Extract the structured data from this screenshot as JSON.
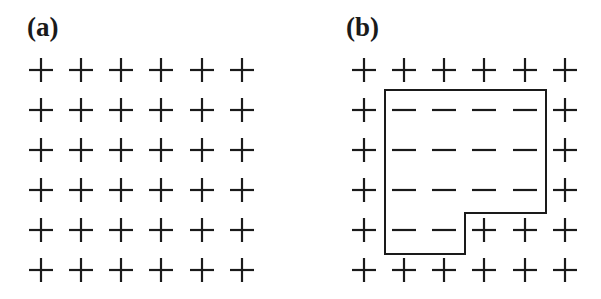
{
  "panels": [
    {
      "label": "(a)",
      "label_x": 27,
      "columns_x": [
        41,
        81,
        121,
        161,
        202,
        242
      ],
      "rows_y": [
        70,
        110,
        150,
        190,
        230,
        270
      ],
      "signs": [
        [
          "+",
          "+",
          "+",
          "+",
          "+",
          "+"
        ],
        [
          "+",
          "+",
          "+",
          "+",
          "+",
          "+"
        ],
        [
          "+",
          "+",
          "+",
          "+",
          "+",
          "+"
        ],
        [
          "+",
          "+",
          "+",
          "+",
          "+",
          "+"
        ],
        [
          "+",
          "+",
          "+",
          "+",
          "+",
          "+"
        ],
        [
          "+",
          "+",
          "+",
          "+",
          "+",
          "+"
        ]
      ],
      "boundary": null
    },
    {
      "label": "(b)",
      "label_x": 346,
      "columns_x": [
        364,
        404,
        444,
        484,
        525,
        565
      ],
      "rows_y": [
        70,
        110,
        150,
        190,
        230,
        270
      ],
      "signs": [
        [
          "+",
          "+",
          "+",
          "+",
          "+",
          "+"
        ],
        [
          "+",
          "-",
          "-",
          "-",
          "-",
          "+"
        ],
        [
          "+",
          "-",
          "-",
          "-",
          "-",
          "+"
        ],
        [
          "+",
          "-",
          "-",
          "-",
          "-",
          "+"
        ],
        [
          "+",
          "-",
          "-",
          "+",
          "+",
          "+"
        ],
        [
          "+",
          "+",
          "+",
          "+",
          "+",
          "+"
        ]
      ],
      "boundary": [
        [
          385,
          90
        ],
        [
          546,
          90
        ],
        [
          546,
          213
        ],
        [
          465,
          213
        ],
        [
          465,
          254
        ],
        [
          385,
          254
        ]
      ]
    }
  ],
  "colors": {
    "ink": "#1a1a1a",
    "background": "#ffffff"
  }
}
